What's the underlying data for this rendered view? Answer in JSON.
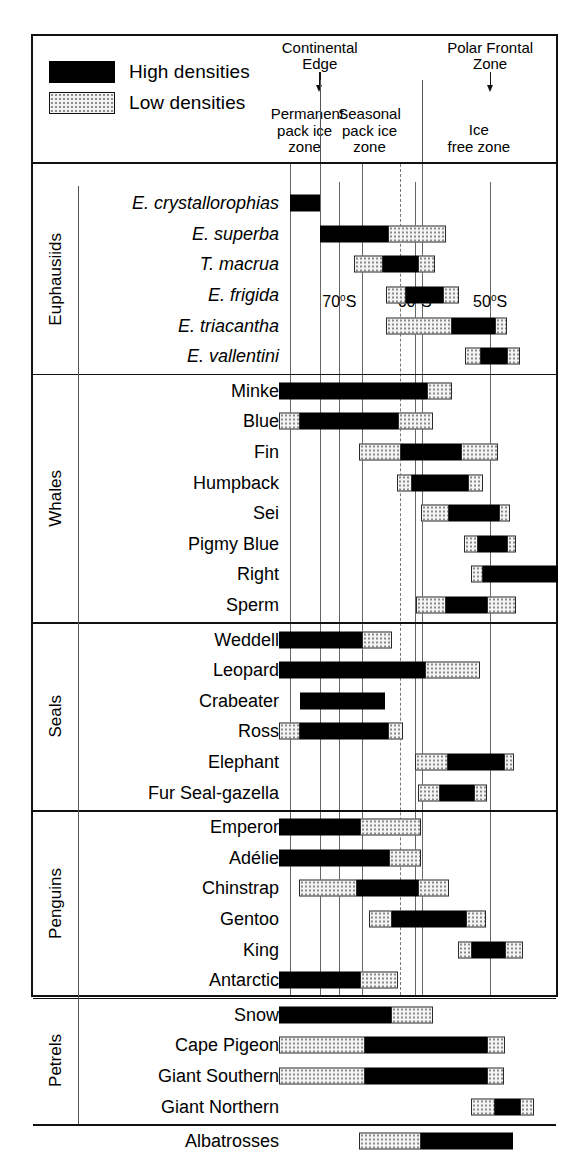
{
  "legend": {
    "items": [
      {
        "label": "High densities",
        "style": "high"
      },
      {
        "label": "Low densities",
        "style": "low"
      }
    ]
  },
  "markers": [
    {
      "name": "continental-edge",
      "line1": "Continental",
      "line2": "Edge",
      "at_x_deg": 72.6
    },
    {
      "name": "polar-frontal-zone",
      "line1": "Polar Frontal",
      "line2": "Zone",
      "at_x_deg": 50.0
    }
  ],
  "zone_captions": [
    {
      "name": "permanent-pack-ice-zone",
      "lines": [
        "Permanent",
        "pack ice",
        "zone"
      ]
    },
    {
      "name": "seasonal-pack-ice-zone",
      "lines": [
        "Seasonal",
        "pack ice",
        "zone"
      ]
    },
    {
      "name": "ice-free-zone",
      "lines": [
        "Ice",
        "free zone"
      ]
    }
  ],
  "chart_data": {
    "type": "bar",
    "xlabel": "Latitude",
    "ylabel": "",
    "grid": true,
    "legend_position": "top-left",
    "axis": {
      "orientation": "horizontal",
      "px_left": 0,
      "px_right": 281,
      "deg_left": 78.0,
      "deg_right": 41.0,
      "ticks": [
        {
          "label": "70°S",
          "value": 70
        },
        {
          "label": "60°S",
          "value": 60
        },
        {
          "label": "50°S",
          "value": 50
        }
      ],
      "zone_boundaries_deg": [
        76.5,
        72.6,
        67.0,
        62.0,
        59.0
      ],
      "dashed_boundary_deg": 62.0
    },
    "value_legend": {
      "high": "High densities",
      "low": "Low densities"
    },
    "groups": [
      {
        "name": "Euphausiids",
        "italic_labels": true,
        "rows": [
          {
            "label": "E. crystallorophias",
            "segments": [
              {
                "type": "high",
                "from": 76.5,
                "to": 72.6
              }
            ]
          },
          {
            "label": "E. superba",
            "segments": [
              {
                "type": "high",
                "from": 72.6,
                "to": 63.5
              },
              {
                "type": "low",
                "from": 63.5,
                "to": 55.8
              }
            ]
          },
          {
            "label": "T. macrua",
            "segments": [
              {
                "type": "low",
                "from": 68.0,
                "to": 64.2
              },
              {
                "type": "high",
                "from": 64.2,
                "to": 59.6
              },
              {
                "type": "low",
                "from": 59.6,
                "to": 57.3
              }
            ]
          },
          {
            "label": "E. frigida",
            "segments": [
              {
                "type": "low",
                "from": 63.8,
                "to": 61.2
              },
              {
                "type": "high",
                "from": 61.2,
                "to": 56.3
              },
              {
                "type": "low",
                "from": 56.3,
                "to": 54.1
              }
            ]
          },
          {
            "label": "E. triacantha",
            "segments": [
              {
                "type": "low",
                "from": 63.8,
                "to": 55.0
              },
              {
                "type": "high",
                "from": 55.0,
                "to": 49.3
              },
              {
                "type": "low",
                "from": 49.3,
                "to": 47.8
              }
            ]
          },
          {
            "label": "E. vallentini",
            "segments": [
              {
                "type": "low",
                "from": 53.3,
                "to": 51.2
              },
              {
                "type": "high",
                "from": 51.2,
                "to": 47.8
              },
              {
                "type": "low",
                "from": 47.8,
                "to": 46.0
              }
            ]
          }
        ]
      },
      {
        "name": "Whales",
        "italic_labels": false,
        "rows": [
          {
            "label": "Minke",
            "segments": [
              {
                "type": "high",
                "from": 78.0,
                "to": 58.4
              },
              {
                "type": "low",
                "from": 58.4,
                "to": 55.0
              }
            ]
          },
          {
            "label": "Blue",
            "segments": [
              {
                "type": "low",
                "from": 78.0,
                "to": 75.2
              },
              {
                "type": "high",
                "from": 75.2,
                "to": 62.2
              },
              {
                "type": "low",
                "from": 62.2,
                "to": 57.6
              }
            ]
          },
          {
            "label": "Fin",
            "segments": [
              {
                "type": "low",
                "from": 67.4,
                "to": 61.8
              },
              {
                "type": "high",
                "from": 61.8,
                "to": 53.8
              },
              {
                "type": "low",
                "from": 53.8,
                "to": 49.0
              }
            ]
          },
          {
            "label": "Humpback",
            "segments": [
              {
                "type": "low",
                "from": 62.4,
                "to": 60.4
              },
              {
                "type": "high",
                "from": 60.4,
                "to": 53.0
              },
              {
                "type": "low",
                "from": 53.0,
                "to": 51.0
              }
            ]
          },
          {
            "label": "Sei",
            "segments": [
              {
                "type": "low",
                "from": 59.2,
                "to": 55.4
              },
              {
                "type": "high",
                "from": 55.4,
                "to": 48.8
              },
              {
                "type": "low",
                "from": 48.8,
                "to": 47.4
              }
            ]
          },
          {
            "label": "Pigmy Blue",
            "segments": [
              {
                "type": "low",
                "from": 53.4,
                "to": 51.6
              },
              {
                "type": "high",
                "from": 51.6,
                "to": 47.8
              },
              {
                "type": "low",
                "from": 47.8,
                "to": 46.6
              }
            ]
          },
          {
            "label": "Right",
            "segments": [
              {
                "type": "low",
                "from": 52.6,
                "to": 51.0
              },
              {
                "type": "high",
                "from": 51.0,
                "to": 41.0
              }
            ]
          },
          {
            "label": "Sperm",
            "segments": [
              {
                "type": "low",
                "from": 59.8,
                "to": 55.8
              },
              {
                "type": "high",
                "from": 55.8,
                "to": 50.4
              },
              {
                "type": "low",
                "from": 50.4,
                "to": 46.6
              }
            ]
          }
        ]
      },
      {
        "name": "Seals",
        "italic_labels": false,
        "rows": [
          {
            "label": "Weddell",
            "segments": [
              {
                "type": "high",
                "from": 78.0,
                "to": 67.0
              },
              {
                "type": "low",
                "from": 67.0,
                "to": 63.0
              }
            ]
          },
          {
            "label": "Leopard",
            "segments": [
              {
                "type": "high",
                "from": 78.0,
                "to": 58.6
              },
              {
                "type": "low",
                "from": 58.6,
                "to": 51.4
              }
            ]
          },
          {
            "label": "Crabeater",
            "segments": [
              {
                "type": "high",
                "from": 75.2,
                "to": 64.0
              }
            ]
          },
          {
            "label": "Ross",
            "segments": [
              {
                "type": "low",
                "from": 78.0,
                "to": 75.2
              },
              {
                "type": "high",
                "from": 75.2,
                "to": 63.6
              },
              {
                "type": "low",
                "from": 63.6,
                "to": 61.6
              }
            ]
          },
          {
            "label": "Elephant",
            "segments": [
              {
                "type": "low",
                "from": 60.0,
                "to": 55.6
              },
              {
                "type": "high",
                "from": 55.6,
                "to": 48.2
              },
              {
                "type": "low",
                "from": 48.2,
                "to": 46.8
              }
            ]
          },
          {
            "label": "Fur Seal-gazella",
            "segments": [
              {
                "type": "low",
                "from": 59.6,
                "to": 56.6
              },
              {
                "type": "high",
                "from": 56.6,
                "to": 52.2
              },
              {
                "type": "low",
                "from": 52.2,
                "to": 50.4
              }
            ]
          }
        ]
      },
      {
        "name": "Penguins",
        "italic_labels": false,
        "rows": [
          {
            "label": "Emperor",
            "segments": [
              {
                "type": "high",
                "from": 78.0,
                "to": 67.2
              },
              {
                "type": "low",
                "from": 67.2,
                "to": 59.2
              }
            ]
          },
          {
            "label": "Adélie",
            "segments": [
              {
                "type": "high",
                "from": 78.0,
                "to": 63.4
              },
              {
                "type": "low",
                "from": 63.4,
                "to": 59.2
              }
            ]
          },
          {
            "label": "Chinstrap",
            "segments": [
              {
                "type": "low",
                "from": 75.4,
                "to": 67.6
              },
              {
                "type": "high",
                "from": 67.6,
                "to": 59.6
              },
              {
                "type": "low",
                "from": 59.6,
                "to": 55.4
              }
            ]
          },
          {
            "label": "Gentoo",
            "segments": [
              {
                "type": "low",
                "from": 66.0,
                "to": 63.0
              },
              {
                "type": "high",
                "from": 63.0,
                "to": 53.2
              },
              {
                "type": "low",
                "from": 53.2,
                "to": 50.6
              }
            ]
          },
          {
            "label": "King",
            "segments": [
              {
                "type": "low",
                "from": 54.2,
                "to": 52.4
              },
              {
                "type": "high",
                "from": 52.4,
                "to": 48.0
              },
              {
                "type": "low",
                "from": 48.0,
                "to": 45.6
              }
            ]
          },
          {
            "label": "Antarctic",
            "segments": [
              {
                "type": "high",
                "from": 78.0,
                "to": 67.2
              },
              {
                "type": "low",
                "from": 67.2,
                "to": 62.2
              }
            ]
          }
        ]
      },
      {
        "name": "Petrels",
        "italic_labels": false,
        "rows": [
          {
            "label": "Snow",
            "segments": [
              {
                "type": "high",
                "from": 78.0,
                "to": 63.2
              },
              {
                "type": "low",
                "from": 63.2,
                "to": 57.6
              }
            ]
          },
          {
            "label": "Cape Pigeon",
            "segments": [
              {
                "type": "low",
                "from": 78.0,
                "to": 66.6
              },
              {
                "type": "high",
                "from": 66.6,
                "to": 50.4
              },
              {
                "type": "low",
                "from": 50.4,
                "to": 48.0
              }
            ]
          },
          {
            "label": "Giant Southern",
            "segments": [
              {
                "type": "low",
                "from": 78.0,
                "to": 66.6
              },
              {
                "type": "high",
                "from": 66.6,
                "to": 50.4
              },
              {
                "type": "low",
                "from": 50.4,
                "to": 48.2
              }
            ]
          },
          {
            "label": "Giant Northern",
            "segments": [
              {
                "type": "low",
                "from": 52.6,
                "to": 49.4
              },
              {
                "type": "high",
                "from": 49.4,
                "to": 46.0
              },
              {
                "type": "low",
                "from": 46.0,
                "to": 44.2
              }
            ]
          }
        ]
      },
      {
        "name": "",
        "italic_labels": false,
        "rows": [
          {
            "label": "Albatrosses",
            "segments": [
              {
                "type": "low",
                "from": 67.4,
                "to": 59.2
              },
              {
                "type": "high",
                "from": 59.2,
                "to": 47.0
              }
            ]
          }
        ]
      }
    ]
  }
}
